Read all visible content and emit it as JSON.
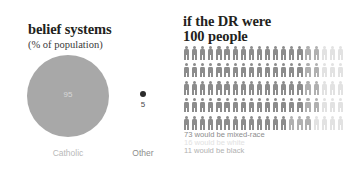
{
  "left": {
    "title": "belief systems",
    "subtitle": "(% of population)",
    "catholic": {
      "label": "Catholic",
      "value": "95"
    },
    "other": {
      "label": "Other",
      "value": "5"
    }
  },
  "right": {
    "title_line1": "if the DR were",
    "title_line2": "100 people",
    "legend": [
      {
        "text": "73 would be mixed-race",
        "color": "#8c8c8c"
      },
      {
        "text": "16 would be white",
        "color": "#e2e2e2"
      },
      {
        "text": "11 would be black",
        "color": "#b0b0b0"
      }
    ]
  },
  "chart_data": [
    {
      "type": "pie",
      "title": "belief systems",
      "subtitle": "(% of population)",
      "categories": [
        "Catholic",
        "Other"
      ],
      "values": [
        95,
        5
      ],
      "unit": "% of population",
      "colors": [
        "#a8a8a8",
        "#2b2b2b"
      ],
      "legend": "below",
      "grid": false
    },
    {
      "type": "pictogram",
      "title": "if the DR were 100 people",
      "total": 100,
      "rows": 5,
      "columns": 20,
      "categories": [
        "mixed-race",
        "white",
        "black"
      ],
      "values": [
        73,
        16,
        11
      ],
      "colors": [
        "#8c8c8c",
        "#e2e2e2",
        "#b0b0b0"
      ],
      "annotations": [
        "73 would be mixed-race",
        "16 would be white",
        "11 would be black"
      ],
      "grid": false,
      "legend": "below"
    }
  ]
}
